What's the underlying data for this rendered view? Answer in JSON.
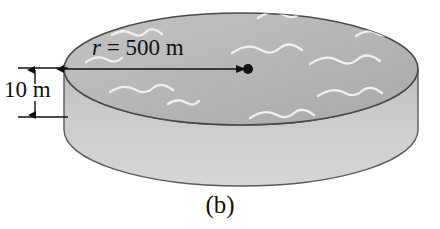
{
  "figure": {
    "caption": "(b)",
    "radius_label": {
      "symbol": "r",
      "equals": " = ",
      "value": "500 m",
      "full": "r = 500 m"
    },
    "height_label": "10 m",
    "shape": "cylindrical disk of water",
    "colors": {
      "top_surface": "#b6b6b6",
      "side_wall": "#c9c9c9",
      "outline": "#4a4a4a",
      "wave": "#efefef",
      "ink": "#111111",
      "background": "#ffffff"
    },
    "geometry": {
      "top_ellipse_cx": 241,
      "top_ellipse_cy": 69,
      "top_ellipse_rx": 177,
      "top_ellipse_ry": 56,
      "wall_height": 61,
      "center_dot_x": 248,
      "center_dot_y": 69,
      "center_dot_r": 5,
      "radius_arrow_from_x": 64,
      "radius_arrow_to_x": 246,
      "radius_arrow_y": 69,
      "dim_line_x": 35,
      "dim_top_y": 68,
      "dim_bottom_y": 117
    },
    "waves": [
      "wave-squiggle-1",
      "wave-squiggle-2",
      "wave-squiggle-3",
      "wave-squiggle-4",
      "wave-squiggle-5",
      "wave-squiggle-6",
      "wave-squiggle-7",
      "wave-squiggle-8",
      "wave-squiggle-9",
      "wave-squiggle-10"
    ]
  }
}
